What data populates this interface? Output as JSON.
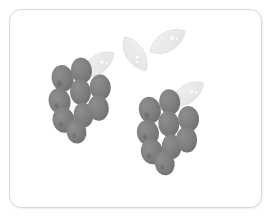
{
  "artwork": {
    "title": "Grayscale grape bunches illustration",
    "subject": "two-bunches-of-grapes-with-leaves",
    "style": "flat-grayscale-clipart",
    "background_color": "#ffffff"
  },
  "frame": {
    "name": "rounded-card-frame",
    "border_color": "#d8d8d8",
    "corner_radius": 12,
    "fill_color": "#ffffff"
  },
  "palette": {
    "grape_fill": "#808080",
    "grape_shadow": "#6e6e6e",
    "grape_highlight": "#b5b5b5",
    "leaf_fill": "#e9e9e9",
    "leaf_edge": "#dcdcdc",
    "leaf_highlight": "#f7f7f7",
    "canvas": "#ffffff"
  },
  "clusters": [
    {
      "id": "left-grape-cluster",
      "label": "Left grape bunch",
      "grape_count": 9,
      "leaf_count": 1,
      "grapes": [
        {
          "cx": 62,
          "cy": 78,
          "rx": 11.0,
          "ry": 13.5,
          "rot": -12
        },
        {
          "cx": 81,
          "cy": 70,
          "rx": 10.5,
          "ry": 13.0,
          "rot": -8
        },
        {
          "cx": 59,
          "cy": 101,
          "rx": 11.0,
          "ry": 13.0,
          "rot": -14
        },
        {
          "cx": 80,
          "cy": 92,
          "rx": 10.5,
          "ry": 13.0,
          "rot": -6
        },
        {
          "cx": 100,
          "cy": 87,
          "rx": 10.5,
          "ry": 13.0,
          "rot": -4
        },
        {
          "cx": 63,
          "cy": 120,
          "rx": 11.0,
          "ry": 13.0,
          "rot": -12
        },
        {
          "cx": 83,
          "cy": 115,
          "rx": 10.0,
          "ry": 12.5,
          "rot": -6
        },
        {
          "cx": 98,
          "cy": 108,
          "rx": 10.5,
          "ry": 13.0,
          "rot": -6
        },
        {
          "cx": 76,
          "cy": 132,
          "rx": 10.0,
          "ry": 12.0,
          "rot": -10
        }
      ],
      "leaf": {
        "cx": 98,
        "cy": 65,
        "rot": -30,
        "w": 40,
        "h": 24
      }
    },
    {
      "id": "right-grape-cluster",
      "label": "Right grape bunch",
      "grape_count": 9,
      "leaf_count": 1,
      "grapes": [
        {
          "cx": 150,
          "cy": 110,
          "rx": 11.0,
          "ry": 13.5,
          "rot": -12
        },
        {
          "cx": 170,
          "cy": 102,
          "rx": 10.5,
          "ry": 13.0,
          "rot": -8
        },
        {
          "cx": 148,
          "cy": 133,
          "rx": 11.0,
          "ry": 13.0,
          "rot": -14
        },
        {
          "cx": 169,
          "cy": 124,
          "rx": 10.5,
          "ry": 13.0,
          "rot": -6
        },
        {
          "cx": 189,
          "cy": 119,
          "rx": 10.5,
          "ry": 13.0,
          "rot": -4
        },
        {
          "cx": 152,
          "cy": 152,
          "rx": 11.0,
          "ry": 13.0,
          "rot": -12
        },
        {
          "cx": 172,
          "cy": 147,
          "rx": 10.0,
          "ry": 12.5,
          "rot": -6
        },
        {
          "cx": 187,
          "cy": 140,
          "rx": 10.5,
          "ry": 13.0,
          "rot": -6
        },
        {
          "cx": 165,
          "cy": 164,
          "rx": 10.0,
          "ry": 12.0,
          "rot": -10
        }
      ],
      "leaf": {
        "cx": 188,
        "cy": 95,
        "rot": -28,
        "w": 40,
        "h": 24
      }
    }
  ],
  "floating_leaves": [
    {
      "id": "leaf-upper-left",
      "label": "Upper-left floating leaf",
      "cx": 134,
      "cy": 54,
      "rot": 62,
      "w": 40,
      "h": 23
    },
    {
      "id": "leaf-upper-right",
      "label": "Upper-right floating leaf",
      "cx": 168,
      "cy": 42,
      "rot": -28,
      "w": 40,
      "h": 24
    }
  ]
}
